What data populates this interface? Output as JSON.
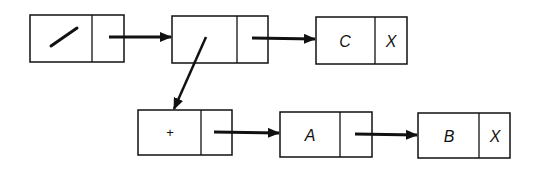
{
  "diagram": {
    "type": "linked-list-structure",
    "stroke_color": "#111111",
    "nodes": [
      {
        "id": "n1",
        "value": "/",
        "value_kind": "slash-glyph",
        "next": "pointer"
      },
      {
        "id": "n2",
        "value": "",
        "value_kind": "pointer-down",
        "next": "pointer"
      },
      {
        "id": "n3",
        "value": "C",
        "next": "X"
      },
      {
        "id": "n4",
        "value": "+",
        "next": "pointer"
      },
      {
        "id": "n5",
        "value": "A",
        "next": "pointer"
      },
      {
        "id": "n6",
        "value": "B",
        "next": "X"
      }
    ],
    "edges": [
      {
        "from": "n1",
        "to": "n2"
      },
      {
        "from": "n2",
        "to": "n3"
      },
      {
        "from": "n2",
        "to": "n4",
        "kind": "down-link"
      },
      {
        "from": "n4",
        "to": "n5"
      },
      {
        "from": "n5",
        "to": "n6"
      }
    ]
  }
}
